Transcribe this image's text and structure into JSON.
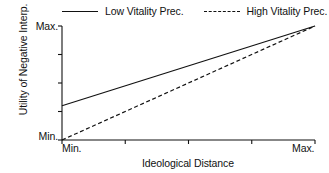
{
  "chart_data": {
    "type": "line",
    "title": "",
    "xlabel": "Ideological Distance",
    "ylabel": "Utility of Negative Interp.",
    "xlim": [
      0,
      1
    ],
    "ylim": [
      0,
      1
    ],
    "grid": false,
    "xtick_labels": [
      "Min.",
      "Max."
    ],
    "ytick_labels": [
      "Max.",
      "Min."
    ],
    "x_min_label": "Min.",
    "x_max_label": "Max.",
    "y_min_label": "Min.",
    "y_max_label": "Max.",
    "x_tick_count": 5,
    "y_tick_count": 5,
    "legend_position": "top",
    "line_color": "#111111",
    "background_color": "#ffffff",
    "series": [
      {
        "name": "Low Vitality Prec.",
        "style": "solid",
        "x": [
          0,
          1
        ],
        "values": [
          0.3,
          1.0
        ]
      },
      {
        "name": "High Vitality Prec.",
        "style": "dashed",
        "x": [
          0,
          1
        ],
        "values": [
          0.0,
          1.0
        ]
      }
    ]
  },
  "legend": {
    "entries": [
      {
        "label": "Low Vitality Prec.",
        "style": "solid"
      },
      {
        "label": "High Vitality Prec.",
        "style": "dashed"
      }
    ]
  }
}
